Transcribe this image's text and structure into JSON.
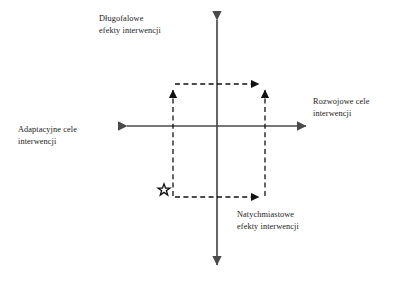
{
  "diagram": {
    "language": "pl",
    "colors": {
      "axis": "#4a4a4a",
      "dashed": "#1a1a1a",
      "text": "#1a1a1a",
      "background": "#ffffff"
    },
    "axes": {
      "vertical": {
        "top_label": {
          "line1": "Długofalowe",
          "line2": "efekty interwencji"
        },
        "bottom_label": {
          "line1": "Natychmiastowe",
          "line2": "efekty interwencji"
        }
      },
      "horizontal": {
        "left_label": {
          "line1": "Adaptacyjne cele",
          "line2": "interwencji"
        },
        "right_label": {
          "line1": "Rozwojowe cele",
          "line2": "interwencji"
        }
      }
    },
    "markers": {
      "star": {
        "icon": "star-outline-icon",
        "x": 164,
        "y": 190
      }
    },
    "dashed_box": {
      "left": 173,
      "right": 265,
      "top": 84,
      "bottom": 197,
      "arrowheads": [
        "top-left-up",
        "top-right-up",
        "top-right-right",
        "bottom-right-right"
      ]
    }
  }
}
